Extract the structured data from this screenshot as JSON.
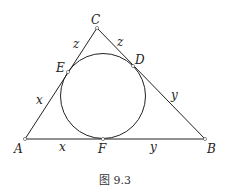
{
  "diagram": {
    "type": "triangle-with-incircle",
    "vertices": {
      "A": "A",
      "B": "B",
      "C": "C"
    },
    "tangent_points": {
      "D": "D",
      "E": "E",
      "F": "F"
    },
    "segment_labels": {
      "AE": "x",
      "AF": "x",
      "BF": "y",
      "BD": "y",
      "CE": "z",
      "CD": "z"
    },
    "caption": "图 9.3",
    "colors": {
      "stroke": "#222222",
      "background": "#ffffff"
    }
  }
}
